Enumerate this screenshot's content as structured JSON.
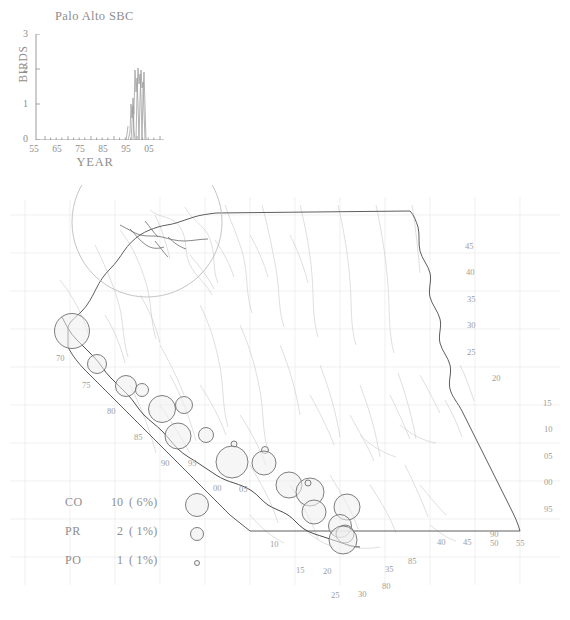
{
  "chart_data": [
    {
      "type": "line",
      "title": "Palo Alto SBC",
      "xlabel": "YEAR",
      "ylabel": "BIRDS",
      "xlim": [
        53,
        8
      ],
      "ylim": [
        0,
        3
      ],
      "xticks": [
        "55",
        "65",
        "75",
        "85",
        "95",
        "05"
      ],
      "xtick_values": [
        55,
        65,
        75,
        85,
        95,
        5
      ],
      "yticks": [
        "0",
        "1",
        "2",
        "3"
      ],
      "ytick_values": [
        0,
        1,
        2,
        3
      ],
      "grid": false,
      "legend": "none",
      "x": [
        53,
        54,
        55,
        56,
        57,
        58,
        59,
        60,
        61,
        62,
        63,
        64,
        65,
        66,
        67,
        68,
        69,
        70,
        71,
        72,
        73,
        74,
        75,
        76,
        77,
        78,
        79,
        80,
        81,
        82,
        83,
        84,
        85,
        86,
        87,
        88,
        89,
        90,
        91,
        92,
        93,
        94,
        95,
        96,
        97,
        98,
        99,
        0,
        1,
        2,
        3,
        4,
        5,
        6,
        7,
        8
      ],
      "values": [
        0,
        0,
        0,
        0,
        0,
        0,
        0,
        0,
        0,
        0,
        0,
        0,
        0,
        0,
        0,
        0,
        0,
        0,
        0,
        0,
        0,
        0,
        0,
        0,
        0,
        0,
        0,
        0,
        0,
        0,
        0,
        0,
        0,
        0,
        0,
        0,
        0,
        0,
        0,
        0.3,
        1,
        0.9,
        2,
        0,
        2,
        0,
        0,
        0,
        0,
        0,
        0,
        0,
        0,
        0,
        0,
        0
      ]
    },
    {
      "type": "scatter",
      "title": "California bird sighting locations",
      "xlabel": "",
      "ylabel": "",
      "grid": true,
      "legend": "bottom-left",
      "symbol": "graduated-circle",
      "points": [
        {
          "x": 72,
          "y": 146,
          "r": 17.5,
          "label": "70"
        },
        {
          "x": 97,
          "y": 179,
          "r": 9.5
        },
        {
          "x": 126,
          "y": 201,
          "r": 10.5,
          "label": "75"
        },
        {
          "x": 142,
          "y": 205,
          "r": 6.5
        },
        {
          "x": 162,
          "y": 224,
          "r": 13.5,
          "label": "80"
        },
        {
          "x": 184,
          "y": 220,
          "r": 8.5
        },
        {
          "x": 178,
          "y": 251,
          "r": 13.0,
          "label": "85"
        },
        {
          "x": 206,
          "y": 250,
          "r": 7.5
        },
        {
          "x": 232,
          "y": 277,
          "r": 16.0,
          "label": "90"
        },
        {
          "x": 234,
          "y": 259,
          "r": 3.0
        },
        {
          "x": 264,
          "y": 278,
          "r": 12.0,
          "label": "95"
        },
        {
          "x": 265,
          "y": 265,
          "r": 3.5
        },
        {
          "x": 289,
          "y": 300,
          "r": 13.0,
          "label": "00"
        },
        {
          "x": 310,
          "y": 307,
          "r": 14.0,
          "label": "05"
        },
        {
          "x": 314,
          "y": 327,
          "r": 12.0
        },
        {
          "x": 347,
          "y": 322,
          "r": 13.0,
          "label": "10"
        },
        {
          "x": 340,
          "y": 341,
          "r": 11.5,
          "label": "15"
        },
        {
          "x": 345,
          "y": 349,
          "r": 9.0
        },
        {
          "x": 343,
          "y": 355,
          "r": 14.0,
          "label": "20"
        },
        {
          "x": 308,
          "y": 298,
          "r": 3.0
        },
        {
          "x": 147,
          "y": 37,
          "r": 75.0
        }
      ]
    }
  ],
  "timeseries": {
    "title": "Palo Alto SBC",
    "xlabel": "YEAR",
    "ylabel": "BIRDS",
    "yticks": [
      "3",
      "2",
      "1",
      "0"
    ],
    "xticks": [
      "55",
      "65",
      "75",
      "85",
      "95",
      "05"
    ]
  },
  "map": {
    "grid_labels": [
      {
        "text": "45",
        "x": 465,
        "y": 241
      },
      {
        "text": "40",
        "x": 466,
        "y": 267
      },
      {
        "text": "35",
        "x": 467,
        "y": 294
      },
      {
        "text": "30",
        "x": 467,
        "y": 320
      },
      {
        "text": "25",
        "x": 467,
        "y": 347
      },
      {
        "text": "20",
        "x": 492,
        "y": 373
      },
      {
        "text": "15",
        "x": 543,
        "y": 398
      },
      {
        "text": "10",
        "x": 544,
        "y": 424
      },
      {
        "text": "05",
        "x": 544,
        "y": 451
      },
      {
        "text": "00",
        "x": 544,
        "y": 477
      },
      {
        "text": "95",
        "x": 544,
        "y": 504
      },
      {
        "text": "90",
        "x": 490,
        "y": 529
      },
      {
        "text": "40",
        "x": 437,
        "y": 537
      },
      {
        "text": "45",
        "x": 463,
        "y": 537
      },
      {
        "text": "50",
        "x": 490,
        "y": 538
      },
      {
        "text": "55",
        "x": 516,
        "y": 538
      },
      {
        "text": "85",
        "x": 408,
        "y": 556
      },
      {
        "text": "35",
        "x": 385,
        "y": 564
      },
      {
        "text": "80",
        "x": 382,
        "y": 581
      },
      {
        "text": "30",
        "x": 358,
        "y": 589
      },
      {
        "text": "25",
        "x": 331,
        "y": 590
      },
      {
        "text": "20",
        "x": 323,
        "y": 566
      },
      {
        "text": "15",
        "x": 296,
        "y": 565
      },
      {
        "text": "10",
        "x": 270,
        "y": 539
      },
      {
        "text": "05",
        "x": 239,
        "y": 484
      },
      {
        "text": "00",
        "x": 213,
        "y": 483
      },
      {
        "text": "95",
        "x": 188,
        "y": 458
      },
      {
        "text": "90",
        "x": 161,
        "y": 458
      },
      {
        "text": "85",
        "x": 134,
        "y": 432
      },
      {
        "text": "80",
        "x": 107,
        "y": 406
      },
      {
        "text": "75",
        "x": 82,
        "y": 380
      },
      {
        "text": "70",
        "x": 56,
        "y": 353
      }
    ]
  },
  "legend": {
    "rows": [
      {
        "code": "CO",
        "count": "10",
        "pct": "(  6%)",
        "radius": 11.5
      },
      {
        "code": "PR",
        "count": "2",
        "pct": "(  1%)",
        "radius": 6.5
      },
      {
        "code": "PO",
        "count": "1",
        "pct": "(  1%)",
        "radius": 2.5
      }
    ]
  },
  "colors": {
    "text": "#8e8e8e",
    "map_outline": "#5a5a5a",
    "map_interior": "#c9c9c9",
    "grid": "#e2e2e2",
    "circle_stroke": "#6f6f6f",
    "circle_fill": "#efefef",
    "series": "#9a9a9a"
  }
}
